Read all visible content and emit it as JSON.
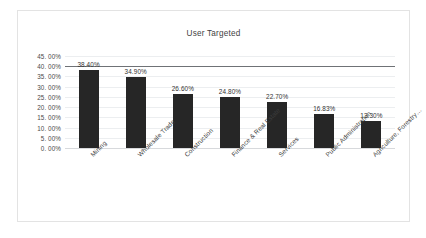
{
  "chart_data": {
    "type": "bar",
    "title": "User Targeted",
    "xlabel": "",
    "ylabel": "",
    "categories": [
      "Mining",
      "Wholesale Trade",
      "Construction",
      "Finance & Real Estate",
      "Services",
      "Public Administration",
      "Agriculture, Forestry…"
    ],
    "values": [
      38.4,
      34.9,
      26.6,
      24.8,
      22.7,
      16.83,
      13.3
    ],
    "data_labels": [
      "38.40%",
      "34.90%",
      "26.60%",
      "24.80%",
      "22.70%",
      "16.83%",
      "13.30%"
    ],
    "ylim": [
      0,
      45
    ],
    "ytick_values": [
      45,
      40,
      35,
      30,
      25,
      20,
      15,
      10,
      5,
      0
    ],
    "ytick_labels": [
      "45. 00%",
      "40. 00%",
      "35. 00%",
      "30. 00%",
      "25. 00%",
      "20. 00%",
      "15. 00%",
      "10. 00%",
      "5. 00%",
      "0. 00%"
    ],
    "grid": true,
    "legend": false,
    "legend_position": "none",
    "series": [
      {
        "name": "User Targeted",
        "values": [
          38.4,
          34.9,
          26.6,
          24.8,
          22.7,
          16.83,
          13.3
        ]
      }
    ],
    "colors": {
      "bar": "#262626",
      "gridline": "#eceef0",
      "emphasis_gridline": "#6f7276",
      "text": "#3f3f3f",
      "plot_background": "#ffffff",
      "border": "#e3e3e3"
    }
  }
}
